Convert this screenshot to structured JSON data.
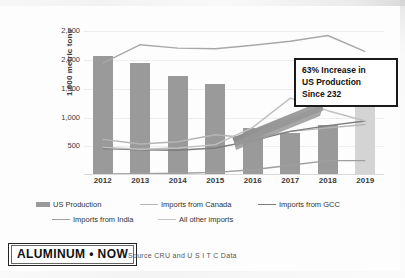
{
  "chart_data": {
    "type": "bar",
    "title": "",
    "xlabel": "",
    "ylabel": "1,000 metric tons",
    "categories": [
      "2012",
      "2013",
      "2014",
      "2015",
      "2016",
      "2017",
      "2018",
      "2019"
    ],
    "ylim": [
      0,
      2700
    ],
    "yticks": [
      500,
      1000,
      1500,
      2000,
      2500
    ],
    "ytick_labels": [
      "500",
      "1,000",
      "1,500",
      "2,000",
      "2,500"
    ],
    "grid": true,
    "legend_position": "bottom",
    "bars": {
      "name": "US Production",
      "values": [
        2080,
        1950,
        1720,
        1580,
        820,
        740,
        870,
        1200
      ],
      "colors": [
        "#9a9a9a",
        "#9a9a9a",
        "#9a9a9a",
        "#9a9a9a",
        "#9a9a9a",
        "#9a9a9a",
        "#9a9a9a",
        "#d4d4d4"
      ],
      "note_2019": "2019 bar shown in lighter shade (projected)"
    },
    "series": [
      {
        "name": "Imports from Canada",
        "values": [
          620,
          540,
          580,
          700,
          640,
          760,
          820,
          880
        ],
        "color": "#b5b5b5"
      },
      {
        "name": "Imports from GCC",
        "values": [
          460,
          440,
          430,
          470,
          600,
          760,
          860,
          940
        ],
        "color": "#7d7d7d"
      },
      {
        "name": "Imports from India",
        "values": [
          20,
          25,
          30,
          45,
          90,
          170,
          250,
          250
        ],
        "color": "#9f9f9f"
      },
      {
        "name": "All other imports",
        "values": [
          1950,
          2270,
          2210,
          2200,
          2260,
          2330,
          2430,
          2150
        ],
        "color": "#a8a8a8"
      },
      {
        "name": "Imports mid-line",
        "values": [
          480,
          450,
          470,
          530,
          830,
          1340,
          1120,
          940
        ],
        "color": "#c0c0c0"
      }
    ]
  },
  "annotation": {
    "line1": "63% Increase in",
    "line2": "US Production",
    "line3": "Since 232"
  },
  "legend": {
    "items": [
      {
        "label": "US Production",
        "marker": "bar",
        "color": "#9a9a9a"
      },
      {
        "label": "Imports from Canada",
        "marker": "line",
        "color": "#b5b5b5"
      },
      {
        "label": "Imports from GCC",
        "marker": "line",
        "color": "#7d7d7d"
      },
      {
        "label": "Imports from India",
        "marker": "line",
        "color": "#9f9f9f"
      },
      {
        "label": "All other imports",
        "marker": "line",
        "color": "#c4c4c4"
      }
    ]
  },
  "footer": {
    "logo": "ALUMINUM • NOW",
    "source": "Source  CRU and U S I T C  Data"
  }
}
